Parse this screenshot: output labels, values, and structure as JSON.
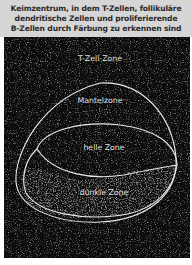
{
  "caption": {
    "line1": "Keimzentrum, in dem T-Zellen, follikuläre",
    "line2": "dendritische Zellen und proliferierende",
    "line3": "B-Zellen durch Färbung zu erkennen sind"
  },
  "zones": {
    "t_cell": "T-Zell-Zone",
    "mantle": "Mantelzone",
    "light": "helle Zone",
    "dark": "dunkle Zone"
  },
  "colors": {
    "caption_bg": "#d6d6d6",
    "photo_bg": "#0b0b0b",
    "outline": "#e8e8e8"
  }
}
